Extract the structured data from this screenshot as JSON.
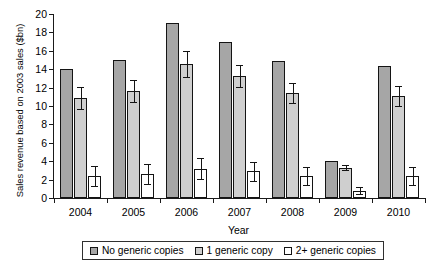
{
  "chart_data": {
    "type": "bar",
    "title": "",
    "xlabel": "Year",
    "ylabel": "Sales revenue based on 2003 sales ($bn)",
    "categories": [
      "2004",
      "2005",
      "2006",
      "2007",
      "2008",
      "2009",
      "2010"
    ],
    "ylim": [
      0,
      20
    ],
    "yticks": [
      0,
      2,
      4,
      6,
      8,
      10,
      12,
      14,
      16,
      18,
      20
    ],
    "ytick_labels": [
      "0",
      "2",
      "4",
      "6",
      "8",
      "10",
      "12",
      "14",
      "16",
      "18",
      "20"
    ],
    "grid": false,
    "legend_position": "bottom",
    "series": [
      {
        "name": "No generic copies",
        "color": "#a6a6a6",
        "values": [
          14.0,
          15.0,
          19.0,
          17.0,
          14.9,
          4.0,
          14.3
        ],
        "errors": [
          0,
          0,
          0,
          0,
          0,
          0,
          0
        ]
      },
      {
        "name": "1 generic copy",
        "color": "#cfcfcf",
        "values": [
          10.9,
          11.6,
          14.6,
          13.3,
          11.4,
          3.3,
          11.1
        ],
        "errors": [
          1.2,
          1.2,
          1.4,
          1.2,
          1.1,
          0.3,
          1.1
        ]
      },
      {
        "name": "2+ generic copies",
        "color": "#ffffff",
        "values": [
          2.4,
          2.6,
          3.2,
          2.9,
          2.4,
          0.8,
          2.4
        ],
        "errors": [
          1.1,
          1.1,
          1.1,
          1.0,
          1.0,
          0.35,
          1.0
        ]
      }
    ]
  },
  "legend": {
    "items": [
      {
        "label": "No generic copies"
      },
      {
        "label": "1 generic copy"
      },
      {
        "label": "2+ generic copies"
      }
    ]
  }
}
